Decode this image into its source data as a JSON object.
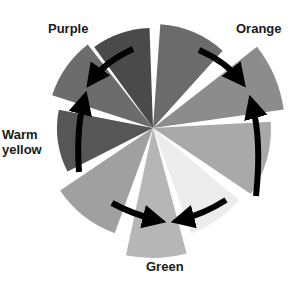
{
  "diagram": {
    "type": "color-wheel",
    "labels": {
      "purple": "Purple",
      "orange": "Orange",
      "warm_yellow": "Warm\nyellow",
      "green": "Green"
    },
    "center": [
      153,
      128
    ],
    "wedges": [
      {
        "name": "top-left",
        "start": -126,
        "end": -92,
        "radius": 100,
        "color": "#4a4a4a"
      },
      {
        "name": "top-right",
        "start": -86,
        "end": -48,
        "radius": 104,
        "color": "#6b6b6b"
      },
      {
        "name": "orange",
        "start": -38,
        "end": -8,
        "radius": 132,
        "color": "#8c8c8c"
      },
      {
        "name": "right",
        "start": -3,
        "end": 34,
        "radius": 118,
        "color": "#a9a9a9"
      },
      {
        "name": "lower-right-light",
        "start": 40,
        "end": 70,
        "radius": 112,
        "color": "#ececec"
      },
      {
        "name": "green",
        "start": 75,
        "end": 102,
        "radius": 130,
        "color": "#b6b6b6"
      },
      {
        "name": "lower-left",
        "start": 110,
        "end": 146,
        "radius": 112,
        "color": "#a0a0a0"
      },
      {
        "name": "warm-yellow",
        "start": 153,
        "end": 191,
        "radius": 96,
        "color": "#565656"
      },
      {
        "name": "upper-left",
        "start": 198,
        "end": 232,
        "radius": 106,
        "color": "#6c6c6c"
      }
    ],
    "arrows": [
      {
        "name": "arrow-to-purple",
        "from": "top-left",
        "to": "upper-left"
      },
      {
        "name": "arrow-from-warm-yellow-up",
        "from": "warm-yellow",
        "to": "upper-left"
      },
      {
        "name": "arrow-to-orange",
        "from": "top-right",
        "to": "orange"
      },
      {
        "name": "arrow-from-right-up",
        "from": "right",
        "to": "orange"
      },
      {
        "name": "arrow-to-green-left",
        "from": "lower-left",
        "to": "green"
      },
      {
        "name": "arrow-to-green-right",
        "from": "lower-right-light",
        "to": "green"
      }
    ]
  }
}
